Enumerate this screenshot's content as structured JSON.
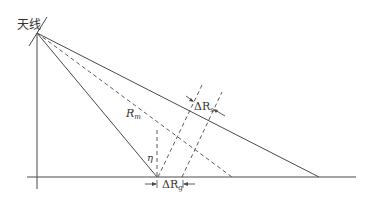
{
  "diagram": {
    "antenna_label": "天线",
    "slant_range_label": "R",
    "slant_range_sub": "m",
    "slant_res_label": "ΔR",
    "slant_res_sub": "s",
    "ground_res_label": "ΔR",
    "ground_res_sub": "g",
    "angle_label": "η",
    "colors": {
      "line": "#4a4a4a",
      "text": "#333333",
      "background": "#ffffff"
    }
  }
}
